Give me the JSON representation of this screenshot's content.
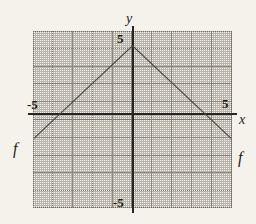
{
  "figure": {
    "kind": "cartesian-graph",
    "background_color": "#f5f2ec",
    "plot_background_color": "#f7f4ef",
    "axis_color": "#262320",
    "major_grid_color": "#8d887e",
    "minor_grid_color": "#78736a",
    "curve_color": "#4a453e"
  },
  "labels": {
    "y_axis_name": "y",
    "x_axis_name": "x",
    "y_top_tick": "5",
    "y_bottom_tick": "-5",
    "x_left_tick": "-5",
    "x_right_tick": "5",
    "function_left": "f",
    "function_right": "f"
  },
  "chart_data": {
    "type": "line",
    "title": "",
    "xlabel": "x",
    "ylabel": "y",
    "xlim": [
      -5.7,
      5.7
    ],
    "ylim": [
      -5.4,
      5.4
    ],
    "grid": true,
    "legend": "none",
    "major_tick_step": 1,
    "minor_tick_step": 0.5,
    "x_ticks": [
      -5,
      5
    ],
    "y_ticks": [
      -5,
      5
    ],
    "annotations": [
      {
        "text": "f",
        "x": -5.35,
        "y": -1.85
      },
      {
        "text": "f",
        "x": 5.4,
        "y": -2.35
      }
    ],
    "series": [
      {
        "name": "f",
        "shape": "inverted-absolute-value",
        "vertex": [
          0,
          4.5
        ],
        "x_intercepts": [
          -4.5,
          4.5
        ],
        "slope_left": 1,
        "slope_right": -1,
        "x": [
          -5.65,
          0,
          5.65
        ],
        "y": [
          -1.15,
          4.5,
          -1.15
        ]
      }
    ]
  }
}
